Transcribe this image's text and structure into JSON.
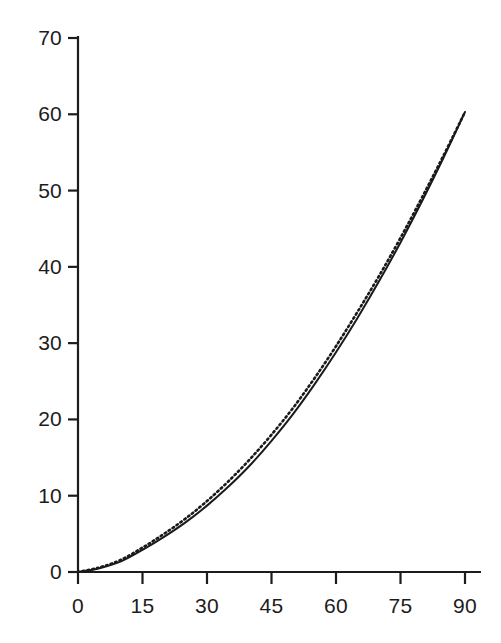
{
  "chart_data": {
    "type": "line",
    "title": "",
    "subtitle": "",
    "xlabel": "",
    "ylabel": "",
    "xlim": [
      0,
      90
    ],
    "ylim": [
      0,
      70
    ],
    "grid": false,
    "legend": "none",
    "xticks": [
      "0",
      "15",
      "30",
      "45",
      "60",
      "75",
      "90"
    ],
    "yticks": [
      "0",
      "10",
      "20",
      "30",
      "40",
      "50",
      "60",
      "70"
    ],
    "xtick_values": [
      0,
      15,
      30,
      45,
      60,
      75,
      90
    ],
    "ytick_values": [
      0,
      10,
      20,
      30,
      40,
      50,
      60,
      70
    ],
    "x": [
      0,
      5,
      10,
      15,
      20,
      25,
      30,
      35,
      40,
      45,
      50,
      55,
      60,
      65,
      70,
      75,
      80,
      85,
      90
    ],
    "series": [
      {
        "name": "solid-curve",
        "style": "solid",
        "color": "#1a1a1a",
        "values": [
          0.0,
          0.5,
          1.4,
          2.9,
          4.6,
          6.5,
          8.7,
          11.2,
          14.0,
          17.2,
          20.7,
          24.6,
          28.8,
          33.3,
          38.1,
          43.2,
          48.6,
          54.3,
          60.3
        ]
      },
      {
        "name": "dotted-curve",
        "style": "dotted",
        "color": "#1a1a1a",
        "values": [
          0.0,
          0.6,
          1.6,
          3.2,
          5.0,
          7.0,
          9.3,
          11.9,
          14.8,
          18.0,
          21.5,
          25.4,
          29.6,
          34.1,
          38.8,
          43.8,
          49.1,
          54.6,
          60.3
        ]
      }
    ]
  },
  "axes": {
    "axis_color": "#1c1c1c",
    "tick_color": "#1c1c1c",
    "background": "#ffffff"
  }
}
